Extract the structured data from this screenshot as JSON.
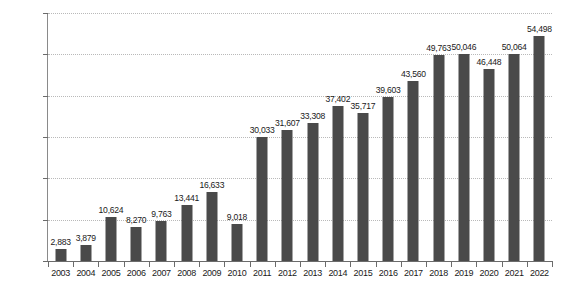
{
  "chart_data": {
    "type": "bar",
    "title": "",
    "subtitle": "",
    "xlabel": "",
    "ylabel": "",
    "ylim": [
      0,
      60000
    ],
    "ytick_step": 10000,
    "ytick_labels": [
      "0",
      "10,000",
      "20,000",
      "30,000",
      "40,000",
      "50,000",
      "60,000"
    ],
    "ytick_values": [
      0,
      10000,
      20000,
      30000,
      40000,
      50000,
      60000
    ],
    "grid": true,
    "grid_style": "dotted-horizontal",
    "legend": null,
    "legend_position": "none",
    "bar_color": "#4a4a4a",
    "gridline_color": "#b9b9b9",
    "axis_color": "#6b6b6b",
    "categories": [
      "2003",
      "2004",
      "2005",
      "2006",
      "2007",
      "2008",
      "2009",
      "2010",
      "2011",
      "2012",
      "2013",
      "2014",
      "2015",
      "2016",
      "2017",
      "2018",
      "2019",
      "2020",
      "2021",
      "2022"
    ],
    "values": [
      2883,
      3879,
      10624,
      8270,
      9763,
      13441,
      16633,
      9018,
      30033,
      31607,
      33308,
      37402,
      35717,
      39603,
      43560,
      49763,
      50046,
      46448,
      50064,
      54498
    ],
    "value_labels": [
      "2,883",
      "3,879",
      "10,624",
      "8,270",
      "9,763",
      "13,441",
      "16,633",
      "9,018",
      "30,033",
      "31,607",
      "33,308",
      "37,402",
      "35,717",
      "39,603",
      "43,560",
      "49,763",
      "50,046",
      "46,448",
      "50,064",
      "54,498"
    ]
  }
}
